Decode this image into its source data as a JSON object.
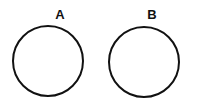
{
  "diagram": {
    "type": "two-circles",
    "background_color": "#ffffff",
    "stroke_color": "#111111",
    "stroke_width": 2,
    "width": 197,
    "height": 106,
    "shapes": [
      {
        "id": "circle-a",
        "shape": "circle",
        "label": "A",
        "cx": 48,
        "cy": 61,
        "r": 35,
        "fill": "none",
        "stroke": "#111111",
        "label_x": 60,
        "label_y": 8
      },
      {
        "id": "circle-b",
        "shape": "circle",
        "label": "B",
        "cx": 144,
        "cy": 62,
        "r": 35,
        "fill": "none",
        "stroke": "#111111",
        "label_x": 152,
        "label_y": 8
      }
    ]
  }
}
